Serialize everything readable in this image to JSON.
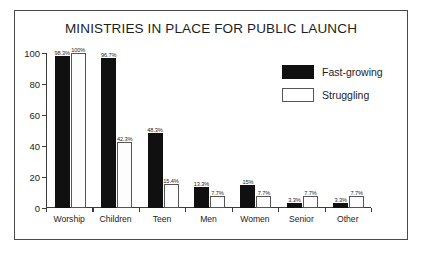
{
  "chart_data": {
    "type": "bar",
    "title": "MINISTRIES IN PLACE FOR PUBLIC LAUNCH",
    "xlabel": "",
    "ylabel": "",
    "ylim": [
      0,
      100
    ],
    "yticks": [
      "0",
      "20",
      "40",
      "60",
      "80",
      "100"
    ],
    "grid": false,
    "legend_position": "top-right",
    "categories": [
      "Worship",
      "Children",
      "Teen",
      "Men",
      "Women",
      "Senior",
      "Other"
    ],
    "series": [
      {
        "name": "Fast-growing",
        "color": "#101010",
        "values": [
          98.3,
          96.7,
          48.3,
          13.3,
          15,
          3.3,
          3.3
        ],
        "labels": [
          "98.3%",
          "96.7%",
          "48.3%",
          "13.3%",
          "15%",
          "3.3%",
          "3.3%"
        ]
      },
      {
        "name": "Struggling",
        "color": "#ffffff",
        "values": [
          100,
          42.3,
          15.4,
          7.7,
          7.7,
          7.7,
          7.7
        ],
        "labels": [
          "100%",
          "42.3%",
          "15.4%",
          "7.7%",
          "7.7%",
          "7.7%",
          "7.7%"
        ]
      }
    ]
  },
  "legend": {
    "items": [
      {
        "label": "Fast-growing"
      },
      {
        "label": "Struggling"
      }
    ]
  }
}
